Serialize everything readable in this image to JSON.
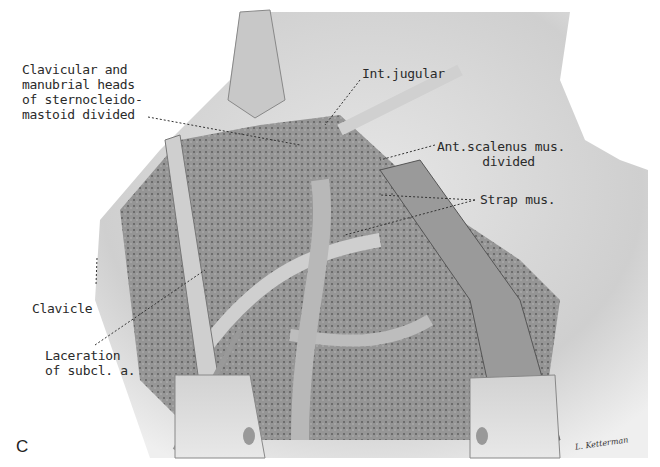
{
  "figure": {
    "panel_letter": "C",
    "signature": "L. Ketterman",
    "labels": {
      "sternocleidomastoid": "Clavicular and\nmanubrial heads\nof sternocleido-\nmastoid divided",
      "int_jugular": "Int.jugular",
      "ant_scalenus": "Ant.scalenus mus.\n      divided",
      "strap_mus": "Strap mus.",
      "clavicle": "Clavicle",
      "laceration": "Laceration\nof subcl. a."
    },
    "colors": {
      "skin": "#d9d9d9",
      "background": "#ffffff",
      "tissue_dark": "#5a5a5a",
      "text": "#2a2a2a"
    }
  }
}
